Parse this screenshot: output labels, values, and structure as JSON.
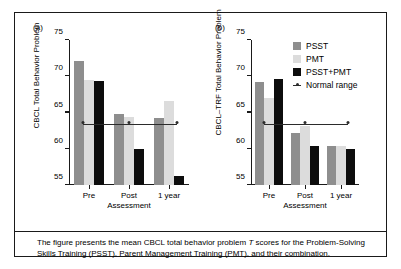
{
  "figure": {
    "panel_a_letter": "(a)",
    "panel_b_letter": "(b)",
    "caption": "The figure presents the mean CBCL total behavior problem T scores for the Problem-Solving Skills Training (PSST), Parent Management Training (PMT), and their combination.",
    "caption_part1": "The figure presents the mean CBCL total behavior problem ",
    "caption_italic": "T",
    "caption_part2": " scores for the Problem-Solving Skills Training (PSST), Parent Management Training (PMT), and their combination."
  },
  "legend": {
    "items": [
      {
        "label": "PSST",
        "color": "#8e8e8e"
      },
      {
        "label": "PMT",
        "color": "#dcdcdc"
      },
      {
        "label": "PSST+PMT",
        "color": "#0d0d0d"
      },
      {
        "label": "Normal range",
        "color": "#2b2b2b"
      }
    ]
  },
  "chart_data": [
    {
      "type": "bar",
      "panel": "(a)",
      "title": "",
      "xlabel": "Assessment",
      "ylabel": "CBCL Total Behavior Problem",
      "categories": [
        "Pre",
        "Post",
        "1 year"
      ],
      "ylim": [
        55,
        75
      ],
      "yticks": [
        55,
        60,
        65,
        70,
        75
      ],
      "grid": false,
      "legend_position": "right-outside",
      "series": [
        {
          "name": "PSST",
          "color": "#8e8e8e",
          "values": [
            72.1,
            64.8,
            64.3
          ]
        },
        {
          "name": "PMT",
          "color": "#dcdcdc",
          "values": [
            69.5,
            64.4,
            66.6
          ]
        },
        {
          "name": "PSST+PMT",
          "color": "#0d0d0d",
          "values": [
            69.4,
            60.0,
            56.3
          ]
        }
      ],
      "annotations": [
        {
          "name": "Normal range",
          "type": "hline-with-markers",
          "value": 63.3,
          "markers_at": [
            "Pre",
            "Post",
            "1 year"
          ]
        }
      ]
    },
    {
      "type": "bar",
      "panel": "(b)",
      "title": "",
      "xlabel": "Assessment",
      "ylabel": "CBCL–TRF Total Behavior Problem",
      "categories": [
        "Pre",
        "Post",
        "1 year"
      ],
      "ylim": [
        55,
        75
      ],
      "yticks": [
        55,
        60,
        65,
        70,
        75
      ],
      "grid": false,
      "legend_position": "right-outside",
      "series": [
        {
          "name": "PSST",
          "color": "#8e8e8e",
          "values": [
            69.2,
            62.2,
            60.4
          ]
        },
        {
          "name": "PMT",
          "color": "#dcdcdc",
          "values": [
            67.0,
            63.1,
            60.4
          ]
        },
        {
          "name": "PSST+PMT",
          "color": "#0d0d0d",
          "values": [
            69.6,
            60.4,
            60.0
          ]
        }
      ],
      "annotations": [
        {
          "name": "Normal range",
          "type": "hline-with-markers",
          "value": 63.3,
          "markers_at": [
            "Pre",
            "Post",
            "1 year"
          ]
        }
      ]
    }
  ]
}
